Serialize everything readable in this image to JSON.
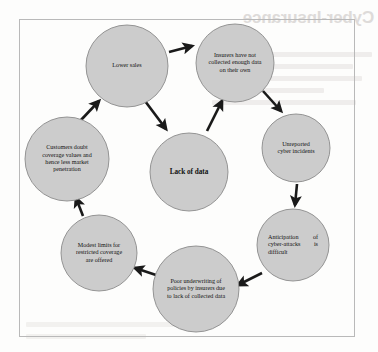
{
  "figure": {
    "type": "cycle-diagram",
    "title_bleed_through": "Cyber-Insurance",
    "frame_color": "#b9b9b9",
    "node_fill_color": "#cccccc",
    "node_stroke_color": "#8a8a8a",
    "arrow_color": "#1a1a1a",
    "background_color": "#fdfdfc"
  },
  "nodes": [
    {
      "id": "lower-sales",
      "label": "Lower sales",
      "position": "top",
      "cx": 127,
      "cy": 66,
      "r": 41,
      "align": "center"
    },
    {
      "id": "insurers-not-collected",
      "label": "Insurers have not collected enough data on their own",
      "position": "top-right",
      "cx": 235,
      "cy": 63,
      "r": 39,
      "align": "center"
    },
    {
      "id": "unreported-incidents",
      "label": "Unreported cyber incidents",
      "position": "right",
      "cx": 296,
      "cy": 148,
      "r": 34,
      "align": "center"
    },
    {
      "id": "anticipation-difficult",
      "label": "Anticipation of cyber-attacks is difficult",
      "position": "bottom-right",
      "cx": 293,
      "cy": 245,
      "r": 36,
      "align": "justified"
    },
    {
      "id": "poor-underwriting",
      "label": "Poor underwriting of policies by insurers due to lack of collected data",
      "position": "bottom",
      "cx": 196,
      "cy": 289,
      "r": 43,
      "align": "center"
    },
    {
      "id": "modest-limits",
      "label": "Modest limits for restricted coverage are offered",
      "position": "bottom-left",
      "cx": 99,
      "cy": 253,
      "r": 38,
      "align": "center"
    },
    {
      "id": "customers-doubt",
      "label": "Customers doubt coverage values and hence less market penetration",
      "position": "left",
      "cx": 67,
      "cy": 159,
      "r": 42,
      "align": "center"
    },
    {
      "id": "lack-of-data",
      "label": "Lack of data",
      "position": "center",
      "cx": 189,
      "cy": 172,
      "r": 39,
      "align": "center",
      "bold": true
    }
  ],
  "arrows": [
    {
      "id": "arrow-lower-sales-to-insurers",
      "from": "lower-sales",
      "to": "insurers-not-collected"
    },
    {
      "id": "arrow-insurers-to-unreported",
      "from": "insurers-not-collected",
      "to": "unreported-incidents"
    },
    {
      "id": "arrow-unreported-to-anticipation",
      "from": "unreported-incidents",
      "to": "anticipation-difficult"
    },
    {
      "id": "arrow-anticipation-to-underwriting",
      "from": "anticipation-difficult",
      "to": "poor-underwriting"
    },
    {
      "id": "arrow-underwriting-to-modest-limits",
      "from": "poor-underwriting",
      "to": "modest-limits"
    },
    {
      "id": "arrow-modest-limits-to-customers",
      "from": "modest-limits",
      "to": "customers-doubt"
    },
    {
      "id": "arrow-customers-to-lower-sales",
      "from": "customers-doubt",
      "to": "lower-sales"
    },
    {
      "id": "arrow-lower-sales-to-lack-of-data",
      "from": "lower-sales",
      "to": "lack-of-data"
    },
    {
      "id": "arrow-lack-of-data-to-insurers",
      "from": "lack-of-data",
      "to": "insurers-not-collected"
    }
  ]
}
